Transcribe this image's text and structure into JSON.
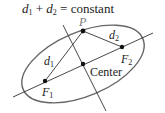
{
  "title": {
    "d1": "d",
    "s1": "1",
    "plus": " + ",
    "d2": "d",
    "s2": "2",
    "rest": " = constant"
  },
  "labels": {
    "P": "P",
    "d1": {
      "var": "d",
      "sub": "1"
    },
    "d2": {
      "var": "d",
      "sub": "2"
    },
    "F1": {
      "var": "F",
      "sub": "1"
    },
    "F2": {
      "var": "F",
      "sub": "2"
    },
    "center": "Center"
  },
  "colors": {
    "ellipse": "#666666",
    "lines": "#333333",
    "points": "#111111",
    "p_label": "#777777"
  }
}
